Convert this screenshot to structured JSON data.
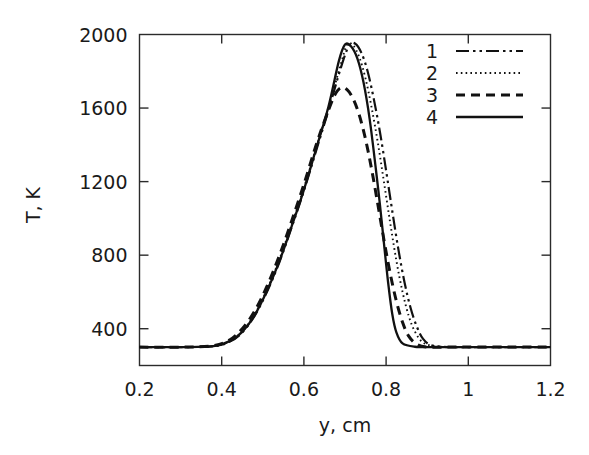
{
  "figure": {
    "title": "",
    "background": "#ffffff",
    "line_color": "#111111"
  },
  "axes": {
    "x": {
      "label": "y, cm",
      "min": 0.2,
      "max": 1.2,
      "ticks": [
        0.2,
        0.4,
        0.6,
        0.8,
        1,
        1.2
      ],
      "tick_labels": [
        "0.2",
        "0.4",
        "0.6",
        "0.8",
        "1",
        "1.2"
      ]
    },
    "y": {
      "label": "T, K",
      "min": 200,
      "max": 2000,
      "ticks": [
        400,
        800,
        1200,
        1600,
        2000
      ],
      "tick_labels": [
        "400",
        "800",
        "1200",
        "1600",
        "2000"
      ]
    }
  },
  "legend": {
    "position": "top-right",
    "entries": [
      {
        "label": "1",
        "style": "dashdotdot"
      },
      {
        "label": "2",
        "style": "dotted"
      },
      {
        "label": "3",
        "style": "dashed"
      },
      {
        "label": "4",
        "style": "solid"
      }
    ]
  },
  "chart_data": {
    "type": "line",
    "title": "",
    "xlabel": "y, cm",
    "ylabel": "T, K",
    "xlim": [
      0.2,
      1.2
    ],
    "ylim": [
      200,
      2000
    ],
    "grid": false,
    "legend_position": "top-right",
    "series": [
      {
        "name": "1",
        "style": "dashdotdot",
        "x": [
          0.2,
          0.3,
          0.38,
          0.42,
          0.45,
          0.48,
          0.51,
          0.54,
          0.57,
          0.6,
          0.63,
          0.66,
          0.69,
          0.71,
          0.725,
          0.74,
          0.755,
          0.77,
          0.785,
          0.8,
          0.815,
          0.83,
          0.845,
          0.86,
          0.875,
          0.89,
          0.91,
          0.95,
          1.0,
          1.1,
          1.2
        ],
        "y": [
          300,
          300,
          305,
          330,
          380,
          470,
          600,
          760,
          950,
          1150,
          1370,
          1590,
          1820,
          1940,
          1950,
          1900,
          1800,
          1650,
          1470,
          1260,
          1040,
          830,
          650,
          510,
          410,
          345,
          310,
          300,
          300,
          300,
          300
        ]
      },
      {
        "name": "2",
        "style": "dotted",
        "x": [
          0.2,
          0.3,
          0.38,
          0.42,
          0.45,
          0.48,
          0.51,
          0.54,
          0.57,
          0.6,
          0.63,
          0.66,
          0.69,
          0.705,
          0.72,
          0.735,
          0.75,
          0.765,
          0.78,
          0.795,
          0.81,
          0.825,
          0.84,
          0.855,
          0.87,
          0.89,
          0.92,
          0.96,
          1.0,
          1.1,
          1.2
        ],
        "y": [
          300,
          300,
          305,
          332,
          385,
          478,
          612,
          775,
          965,
          1165,
          1385,
          1605,
          1840,
          1945,
          1940,
          1875,
          1760,
          1600,
          1410,
          1195,
          975,
          770,
          600,
          470,
          385,
          325,
          305,
          300,
          300,
          300,
          300
        ]
      },
      {
        "name": "3",
        "style": "dashed",
        "x": [
          0.2,
          0.3,
          0.38,
          0.42,
          0.45,
          0.48,
          0.51,
          0.54,
          0.57,
          0.6,
          0.63,
          0.655,
          0.675,
          0.69,
          0.705,
          0.72,
          0.735,
          0.75,
          0.765,
          0.78,
          0.795,
          0.81,
          0.825,
          0.84,
          0.855,
          0.875,
          0.9,
          0.95,
          1.0,
          1.1,
          1.2
        ],
        "y": [
          300,
          300,
          308,
          340,
          400,
          495,
          630,
          795,
          985,
          1185,
          1400,
          1560,
          1670,
          1710,
          1700,
          1650,
          1560,
          1430,
          1265,
          1075,
          880,
          700,
          550,
          435,
          360,
          315,
          300,
          300,
          300,
          300,
          300
        ]
      },
      {
        "name": "4",
        "style": "solid",
        "x": [
          0.2,
          0.3,
          0.38,
          0.42,
          0.45,
          0.48,
          0.51,
          0.54,
          0.57,
          0.6,
          0.63,
          0.66,
          0.685,
          0.7,
          0.715,
          0.73,
          0.745,
          0.76,
          0.775,
          0.785,
          0.795,
          0.805,
          0.815,
          0.825,
          0.84,
          0.87,
          0.92,
          0.98,
          1.05,
          1.12,
          1.2
        ],
        "y": [
          300,
          300,
          305,
          333,
          383,
          473,
          605,
          765,
          955,
          1155,
          1380,
          1610,
          1855,
          1945,
          1935,
          1870,
          1740,
          1540,
          1270,
          1075,
          860,
          650,
          480,
          380,
          320,
          302,
          300,
          300,
          300,
          300,
          300
        ]
      }
    ]
  }
}
